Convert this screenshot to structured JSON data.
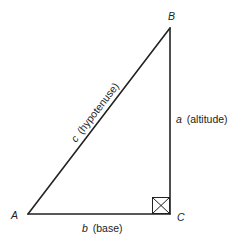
{
  "diagram": {
    "type": "right-triangle",
    "vertices": {
      "A": {
        "label": "A"
      },
      "B": {
        "label": "B"
      },
      "C": {
        "label": "C"
      }
    },
    "sides": {
      "hypotenuse": {
        "var": "c",
        "desc": "(hypotenuse)"
      },
      "altitude": {
        "var": "a",
        "desc": "(altitude)"
      },
      "base": {
        "var": "b",
        "desc": "(base)"
      }
    },
    "right_angle_marker": "square-with-x at C",
    "stroke_color": "#222222"
  }
}
